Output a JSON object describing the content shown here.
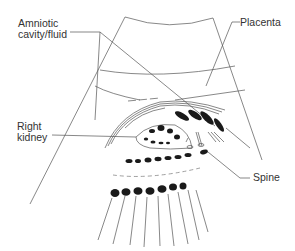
{
  "labels": {
    "amniotic": "Amniotic\ncavity/fluid",
    "placenta": "Placenta",
    "kidney": "Right\nkidney",
    "spine": "Spine"
  },
  "colors": {
    "line": "#555555",
    "fill": "#1a1a1a",
    "text": "#333333",
    "background": "#ffffff"
  }
}
